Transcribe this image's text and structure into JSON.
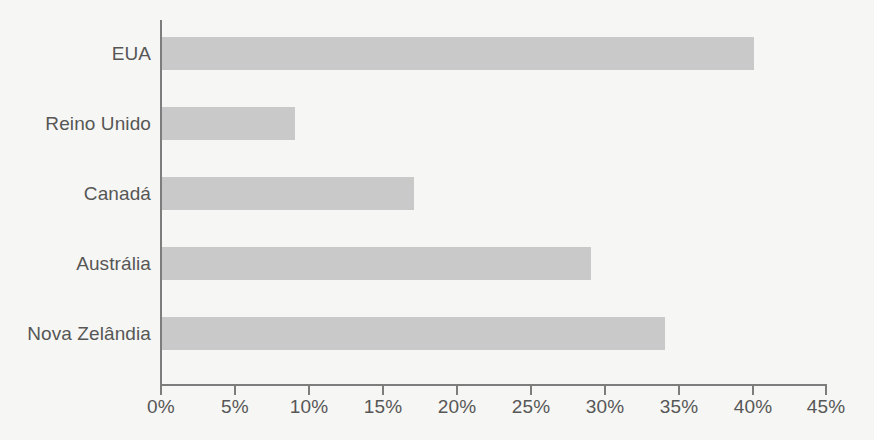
{
  "chart_data": {
    "type": "bar",
    "orientation": "horizontal",
    "title": "",
    "subtitle": "",
    "xlabel": "",
    "ylabel": "",
    "categories": [
      "EUA",
      "Reino Unido",
      "Canadá",
      "Austrália",
      "Nova Zelândia"
    ],
    "values": [
      40,
      9,
      17,
      29,
      34
    ],
    "value_suffix": "%",
    "xlim": [
      0,
      45
    ],
    "xtick_values": [
      0,
      5,
      10,
      15,
      20,
      25,
      30,
      35,
      40,
      45
    ],
    "xtick_labels": [
      "0%",
      "5%",
      "10%",
      "15%",
      "20%",
      "25%",
      "30%",
      "35%",
      "40%",
      "45%"
    ],
    "grid": false,
    "legend": false,
    "legend_position": "none",
    "series": [
      {
        "name": "",
        "values": [
          40,
          9,
          17,
          29,
          34
        ]
      }
    ],
    "colors": {
      "bar": "#c9c9c9",
      "axis": "#7d7d7d",
      "text": "#565656",
      "background": "#f6f6f4"
    }
  }
}
